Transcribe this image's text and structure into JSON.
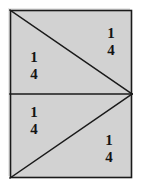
{
  "figure": {
    "shape": "rectangle",
    "fill_color": "#d2d2d2",
    "stroke_color": "#1a1a1a",
    "background_color": "#ffffff",
    "rect": {
      "x": 10,
      "y": 10,
      "width": 122,
      "height": 168
    },
    "vertex_point": {
      "x": 132,
      "y": 94
    },
    "dividers": [
      {
        "name": "upper-diagonal",
        "from": [
          10,
          10
        ],
        "to": [
          132,
          94
        ]
      },
      {
        "name": "horizontal-midline",
        "from": [
          10,
          94
        ],
        "to": [
          132,
          94
        ]
      },
      {
        "name": "lower-diagonal",
        "from": [
          10,
          178
        ],
        "to": [
          132,
          94
        ]
      }
    ],
    "regions": [
      {
        "name": "top-right-region",
        "label": "1/4",
        "numerator": "1",
        "denominator": "4"
      },
      {
        "name": "middle-left-region",
        "label": "1/4",
        "numerator": "1",
        "denominator": "4"
      },
      {
        "name": "lower-left-region",
        "label": "1/4",
        "numerator": "1",
        "denominator": "4"
      },
      {
        "name": "bottom-right-region",
        "label": "1/4",
        "numerator": "1",
        "denominator": "4"
      }
    ]
  }
}
